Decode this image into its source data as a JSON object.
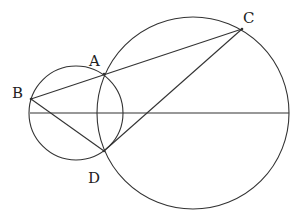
{
  "diagram": {
    "type": "geometry",
    "stroke_color": "#333333",
    "background": "#ffffff",
    "points": {
      "A": {
        "label": "A",
        "x": 104,
        "y": 74
      },
      "B": {
        "label": "B",
        "x": 31,
        "y": 99
      },
      "C": {
        "label": "C",
        "x": 242,
        "y": 29
      },
      "D": {
        "label": "D",
        "x": 104,
        "y": 151
      }
    },
    "circles": [
      {
        "name": "small-circle",
        "cx": 76,
        "cy": 113,
        "r": 47
      },
      {
        "name": "large-circle",
        "cx": 193,
        "cy": 113,
        "r": 96
      }
    ],
    "segments": [
      {
        "name": "segment-BC",
        "from": "B",
        "to": "C"
      },
      {
        "name": "segment-BD",
        "from": "B",
        "to": "D"
      },
      {
        "name": "segment-DC",
        "from": "D",
        "to": "C"
      },
      {
        "name": "horizontal-line",
        "x1": 30,
        "y1": 113,
        "x2": 289,
        "y2": 113
      }
    ],
    "labels": [
      {
        "text": "B",
        "x": 12,
        "y": 98
      },
      {
        "text": "A",
        "x": 89,
        "y": 66
      },
      {
        "text": "C",
        "x": 243,
        "y": 23
      },
      {
        "text": "D",
        "x": 88,
        "y": 183
      }
    ]
  }
}
